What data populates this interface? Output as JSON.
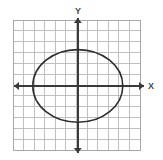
{
  "figure": {
    "width": 163,
    "height": 160,
    "background_color": "#ffffff"
  },
  "grid": {
    "left": 13,
    "top": 20,
    "right": 140,
    "bottom": 150,
    "columns": 12,
    "rows": 12,
    "cell_width": 10.58,
    "cell_height": 10.83,
    "line_color": "#b9b9b9",
    "border_color": "#a8a8a8",
    "visible": true
  },
  "axes": {
    "origin_x": 77.8,
    "origin_y": 85.9,
    "color": "#3a3a3a",
    "x_axis": {
      "label": "X",
      "label_x": 151,
      "label_y": 89,
      "start_x": 14,
      "end_x": 144,
      "y": 85.9,
      "arrow_left": true,
      "arrow_right": true
    },
    "y_axis": {
      "label": "Y",
      "label_x": 78,
      "label_y": 14,
      "start_y": 18,
      "end_y": 153,
      "x": 77.8,
      "arrow_up": true,
      "arrow_down": true
    }
  },
  "chart_data": {
    "type": "line",
    "xlabel": "X",
    "ylabel": "Y",
    "grid": true,
    "legend": "none",
    "curve": "ellipse",
    "equation": "x^2/a^2 + y^2/b^2 = 1",
    "center": [
      0,
      0
    ],
    "semi_axis_a_cells": 4.25,
    "semi_axis_b_cells": 3.35,
    "semi_axis_a_px": 45,
    "semi_axis_b_px": 36.3,
    "x_intercepts": [
      -4.25,
      4.25
    ],
    "y_intercepts": [
      -3.35,
      3.35
    ],
    "xlim": [
      -6.1,
      5.9
    ],
    "ylim": [
      -5.9,
      6.1
    ],
    "stroke_color": "#2e2e2e",
    "stroke_width": 1.6,
    "series": [
      {
        "name": "ellipse",
        "closed": true,
        "points": [
          [
            4.25,
            0.0
          ],
          [
            4.1,
            0.87
          ],
          [
            3.68,
            1.68
          ],
          [
            3.0,
            2.37
          ],
          [
            2.13,
            2.9
          ],
          [
            1.1,
            3.24
          ],
          [
            0.0,
            3.35
          ],
          [
            -1.1,
            3.24
          ],
          [
            -2.13,
            2.9
          ],
          [
            -3.0,
            2.37
          ],
          [
            -3.68,
            1.68
          ],
          [
            -4.1,
            0.87
          ],
          [
            -4.25,
            0.0
          ],
          [
            -4.1,
            -0.87
          ],
          [
            -3.68,
            -1.68
          ],
          [
            -3.0,
            -2.37
          ],
          [
            -2.13,
            -2.9
          ],
          [
            -1.1,
            -3.24
          ],
          [
            0.0,
            -3.35
          ],
          [
            1.1,
            -3.24
          ],
          [
            2.13,
            -2.9
          ],
          [
            3.0,
            -2.37
          ],
          [
            3.68,
            -1.68
          ],
          [
            4.1,
            -0.87
          ]
        ]
      }
    ]
  },
  "ellipse_render": {
    "cx": 77.8,
    "cy": 85.9,
    "rx": 45,
    "ry": 36.3
  },
  "watermark": {
    "text": "",
    "visible": false
  }
}
